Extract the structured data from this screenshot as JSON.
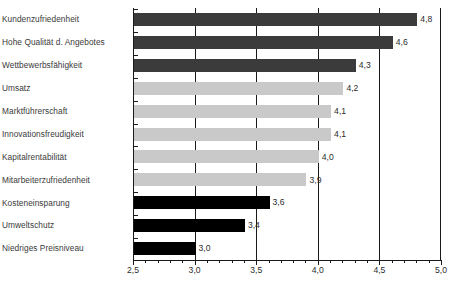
{
  "chart_data": {
    "type": "bar",
    "orientation": "horizontal",
    "title": "",
    "subtitle": "",
    "xlabel": "",
    "ylabel": "",
    "xlim": [
      2.5,
      5.0
    ],
    "grid": true,
    "gridlines_at": [
      3.0,
      3.5,
      4.0,
      4.5,
      5.0
    ],
    "legend": null,
    "xticks_major": [
      2.5,
      3.0,
      3.5,
      4.0,
      4.5,
      5.0
    ],
    "xtick_labels": [
      "2,5",
      "3,0",
      "3,5",
      "4,0",
      "4,5",
      "5,0"
    ],
    "minor_ticks_per_interval": 4,
    "categories": [
      "Kundenzufriedenheit",
      "Hohe Qualität d. Angebotes",
      "Wettbewerbsfähigkeit",
      "Umsatz",
      "Marktführerschaft",
      "Innovationsfreudigkeit",
      "Kapitalrentabilität",
      "Mitarbeiterzufriedenheit",
      "Kosteneinsparung",
      "Umweltschutz",
      "Niedriges Preisniveau"
    ],
    "values": [
      4.8,
      4.6,
      4.3,
      4.2,
      4.1,
      4.1,
      4.0,
      3.9,
      3.6,
      3.4,
      3.0
    ],
    "value_labels": [
      "4,8",
      "4,6",
      "4,3",
      "4,2",
      "4,1",
      "4,1",
      "4,0",
      "3,9",
      "3,6",
      "3,4",
      "3,0"
    ],
    "bar_colors": [
      "#3b3b3b",
      "#3b3b3b",
      "#3b3b3b",
      "#c9c9c9",
      "#c9c9c9",
      "#c9c9c9",
      "#c9c9c9",
      "#c9c9c9",
      "#000000",
      "#000000",
      "#000000"
    ],
    "color_groups": [
      {
        "name": "dark-gray",
        "hex": "#3b3b3b",
        "categories": [
          "Kundenzufriedenheit",
          "Hohe Qualität d. Angebotes",
          "Wettbewerbsfähigkeit"
        ]
      },
      {
        "name": "light-gray",
        "hex": "#c9c9c9",
        "categories": [
          "Umsatz",
          "Marktführerschaft",
          "Innovationsfreudigkeit",
          "Kapitalrentabilität",
          "Mitarbeiterzufriedenheit"
        ]
      },
      {
        "name": "black",
        "hex": "#000000",
        "categories": [
          "Kosteneinsparung",
          "Umweltschutz",
          "Niedriges Preisniveau"
        ]
      }
    ],
    "axis_color": "#1a1a1a",
    "label_color": "#3a3a3a",
    "background": "#ffffff"
  }
}
